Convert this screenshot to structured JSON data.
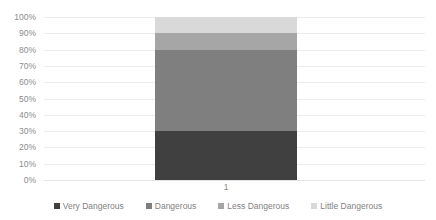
{
  "chart_data": {
    "type": "bar",
    "stacked": true,
    "orientation": "vertical",
    "title": "",
    "subtitle": "",
    "xlabel": "",
    "ylabel": "",
    "categories": [
      "1"
    ],
    "ylim": [
      0,
      100
    ],
    "y_tick_labels": [
      "100%",
      "90%",
      "80%",
      "70%",
      "60%",
      "50%",
      "40%",
      "30%",
      "20%",
      "10%",
      "0%"
    ],
    "y_tick_values": [
      100,
      90,
      80,
      70,
      60,
      50,
      40,
      30,
      20,
      10,
      0
    ],
    "grid": "horizontal",
    "legend_position": "bottom",
    "value_unit": "percent",
    "series": [
      {
        "name": "Very Dangerous",
        "values": [
          30
        ],
        "color": "#404040",
        "range": [
          0,
          30
        ]
      },
      {
        "name": "Dangerous",
        "values": [
          50
        ],
        "color": "#7f7f7f",
        "range": [
          30,
          80
        ]
      },
      {
        "name": "Less Dangerous",
        "values": [
          10
        ],
        "color": "#a6a6a6",
        "range": [
          80,
          90
        ]
      },
      {
        "name": "Little Dangerous",
        "values": [
          10
        ],
        "color": "#d9d9d9",
        "range": [
          90,
          100
        ]
      }
    ]
  },
  "axis": {
    "y_ticks": [
      {
        "label": "100%",
        "value": 100
      },
      {
        "label": "90%",
        "value": 90
      },
      {
        "label": "80%",
        "value": 80
      },
      {
        "label": "70%",
        "value": 70
      },
      {
        "label": "60%",
        "value": 60
      },
      {
        "label": "50%",
        "value": 50
      },
      {
        "label": "40%",
        "value": 40
      },
      {
        "label": "30%",
        "value": 30
      },
      {
        "label": "20%",
        "value": 20
      },
      {
        "label": "10%",
        "value": 10
      },
      {
        "label": "0%",
        "value": 0
      }
    ],
    "x_ticks": [
      {
        "label": "1"
      }
    ]
  },
  "legend": {
    "items": [
      {
        "label": "Very Dangerous",
        "color": "#404040"
      },
      {
        "label": "Dangerous",
        "color": "#7f7f7f"
      },
      {
        "label": "Less Dangerous",
        "color": "#a6a6a6"
      },
      {
        "label": "Little Dangerous",
        "color": "#d9d9d9"
      }
    ]
  },
  "colors": {
    "gridline": "#ececec",
    "axis_text": "#8c8c8c",
    "legend_text": "#7f7f7f",
    "background": "#ffffff"
  }
}
